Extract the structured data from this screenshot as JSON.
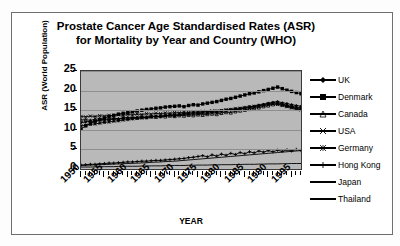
{
  "chart_data": {
    "type": "line",
    "title": "Prostate Cancer Age Standardised Rates (ASR) for Mortality by Year and Country (WHO)",
    "title_line1": "Prostate Cancer Age Standardised Rates (ASR)",
    "title_line2": "for Mortality by Year and Country (WHO)",
    "xlabel": "YEAR",
    "ylabel": "ASR (World Population)",
    "ylim": [
      0,
      25
    ],
    "yticks": [
      0,
      5,
      10,
      15,
      20,
      25
    ],
    "xlim": [
      1950,
      1997
    ],
    "xticks": [
      1950,
      1955,
      1960,
      1965,
      1970,
      1975,
      1980,
      1985,
      1990,
      1995
    ],
    "grid": true,
    "legend_position": "right",
    "x": [
      1950,
      1951,
      1952,
      1953,
      1954,
      1955,
      1956,
      1957,
      1958,
      1959,
      1960,
      1961,
      1962,
      1963,
      1964,
      1965,
      1966,
      1967,
      1968,
      1969,
      1970,
      1971,
      1972,
      1973,
      1974,
      1975,
      1976,
      1977,
      1978,
      1979,
      1980,
      1981,
      1982,
      1983,
      1984,
      1985,
      1986,
      1987,
      1988,
      1989,
      1990,
      1991,
      1992,
      1993,
      1994,
      1995,
      1996,
      1997
    ],
    "series": [
      {
        "name": "UK",
        "marker": "diamond",
        "values": [
          11.8,
          12.0,
          12.2,
          12.1,
          12.4,
          12.6,
          12.5,
          12.8,
          12.7,
          13.0,
          13.1,
          12.9,
          13.2,
          13.3,
          13.1,
          13.4,
          13.5,
          13.3,
          13.6,
          13.7,
          13.5,
          13.8,
          14.0,
          13.9,
          14.1,
          14.0,
          14.3,
          14.2,
          14.5,
          14.4,
          14.7,
          14.9,
          15.1,
          15.0,
          15.4,
          15.6,
          15.8,
          16.0,
          16.3,
          16.5,
          16.8,
          17.0,
          17.2,
          16.9,
          16.7,
          16.4,
          16.2,
          16.0
        ]
      },
      {
        "name": "Denmark",
        "marker": "square",
        "values": [
          10.2,
          11.0,
          11.6,
          12.2,
          12.6,
          13.0,
          13.4,
          13.7,
          14.0,
          14.2,
          14.4,
          14.6,
          14.8,
          15.0,
          15.2,
          15.3,
          15.5,
          15.6,
          15.8,
          15.9,
          16.0,
          16.1,
          15.9,
          16.2,
          16.4,
          16.3,
          16.6,
          16.8,
          17.0,
          17.2,
          17.5,
          17.8,
          18.0,
          18.3,
          18.6,
          18.9,
          19.2,
          19.4,
          19.7,
          20.0,
          20.3,
          20.6,
          20.9,
          20.5,
          20.1,
          19.8,
          19.5,
          19.2
        ]
      },
      {
        "name": "Canada",
        "marker": "triangle",
        "values": [
          12.5,
          12.6,
          12.4,
          12.7,
          12.8,
          12.6,
          12.9,
          13.0,
          12.8,
          13.1,
          13.0,
          13.2,
          13.1,
          13.3,
          13.2,
          13.4,
          13.3,
          13.5,
          13.4,
          13.6,
          13.5,
          13.7,
          13.6,
          13.8,
          13.7,
          13.9,
          13.8,
          14.0,
          14.1,
          14.0,
          14.3,
          14.5,
          14.4,
          14.7,
          14.9,
          15.1,
          15.3,
          15.5,
          15.7,
          16.0,
          16.2,
          16.5,
          16.7,
          16.4,
          16.1,
          15.8,
          15.5,
          15.3
        ]
      },
      {
        "name": "USA",
        "marker": "cross-x",
        "values": [
          13.4,
          13.3,
          13.5,
          13.4,
          13.6,
          13.5,
          13.7,
          13.6,
          13.8,
          13.7,
          13.9,
          13.8,
          14.0,
          13.9,
          14.1,
          14.0,
          14.2,
          14.1,
          14.3,
          14.2,
          14.4,
          14.3,
          14.5,
          14.4,
          14.6,
          14.5,
          14.7,
          14.6,
          14.8,
          14.7,
          14.9,
          15.0,
          15.1,
          15.2,
          15.3,
          15.5,
          15.6,
          15.8,
          16.0,
          16.2,
          16.4,
          16.6,
          16.5,
          16.2,
          15.9,
          15.6,
          15.3,
          15.1
        ]
      },
      {
        "name": "Germany",
        "marker": "asterisk",
        "values": [
          11.0,
          11.2,
          11.4,
          11.5,
          11.7,
          11.9,
          12.0,
          12.2,
          12.3,
          12.5,
          12.6,
          12.8,
          12.9,
          13.0,
          13.2,
          13.3,
          13.4,
          13.5,
          13.7,
          13.8,
          13.9,
          14.0,
          14.1,
          14.2,
          14.3,
          14.4,
          14.5,
          14.6,
          14.7,
          14.8,
          14.9,
          15.1,
          15.2,
          15.4,
          15.5,
          15.7,
          15.9,
          16.0,
          16.2,
          16.4,
          16.6,
          16.8,
          16.9,
          16.6,
          16.3,
          16.0,
          15.8,
          15.6
        ]
      },
      {
        "name": "Hong Kong",
        "marker": "plus",
        "values": [
          1.0,
          1.1,
          1.2,
          1.2,
          1.3,
          1.4,
          1.5,
          1.5,
          1.6,
          1.7,
          1.8,
          1.8,
          1.9,
          2.0,
          2.0,
          2.1,
          2.2,
          2.2,
          2.3,
          2.4,
          2.5,
          2.6,
          2.7,
          2.9,
          3.0,
          3.2,
          3.4,
          3.1,
          3.6,
          3.3,
          3.8,
          3.5,
          4.0,
          3.7,
          4.2,
          3.9,
          4.4,
          4.1,
          4.6,
          4.3,
          4.7,
          4.4,
          4.8,
          4.5,
          4.9,
          4.6,
          5.0,
          4.7
        ]
      },
      {
        "name": "Japan",
        "marker": "none",
        "values": [
          0.9,
          0.95,
          1.0,
          1.05,
          1.1,
          1.15,
          1.2,
          1.25,
          1.3,
          1.35,
          1.4,
          1.45,
          1.5,
          1.55,
          1.6,
          1.7,
          1.75,
          1.8,
          1.9,
          1.95,
          2.0,
          2.1,
          2.2,
          2.3,
          2.4,
          2.5,
          2.6,
          2.7,
          2.8,
          2.9,
          3.0,
          3.1,
          3.2,
          3.3,
          3.4,
          3.5,
          3.6,
          3.7,
          3.8,
          3.9,
          4.0,
          4.1,
          4.2,
          4.3,
          4.4,
          4.5,
          4.6,
          4.7
        ]
      },
      {
        "name": "Thailand",
        "marker": "none",
        "values": [
          0.5,
          0.5,
          0.5,
          0.55,
          0.55,
          0.6,
          0.6,
          0.6,
          0.65,
          0.65,
          0.7,
          0.7,
          0.7,
          0.75,
          0.75,
          0.8,
          0.8,
          0.8,
          0.85,
          0.85,
          0.9,
          0.9,
          0.9,
          0.95,
          0.95,
          1.0,
          1.0,
          1.0,
          1.05,
          1.05,
          1.1,
          1.1,
          1.1,
          1.15,
          1.15,
          1.2,
          1.2,
          1.2,
          1.25,
          1.25,
          1.3,
          1.3,
          1.3,
          1.35,
          1.35,
          1.4,
          1.4,
          1.4
        ]
      }
    ]
  },
  "colors": {
    "plot_background": "#b9b9b9",
    "gridline": "#8e8e8e",
    "series": "#000000",
    "frame_border": "#6f6f6f",
    "page_background": "#fdfdfd"
  }
}
